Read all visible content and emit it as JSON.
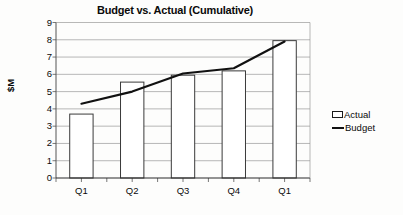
{
  "chart_data": {
    "type": "bar",
    "title": "Budget vs. Actual (Cumulative)",
    "xlabel": "",
    "ylabel": "$M",
    "categories": [
      "Q1",
      "Q2",
      "Q3",
      "Q4",
      "Q1"
    ],
    "yticks": [
      0,
      1,
      2,
      3,
      4,
      5,
      6,
      7,
      8,
      9
    ],
    "ylim": [
      0,
      9
    ],
    "grid": true,
    "legend_position": "right",
    "series": [
      {
        "name": "Actual",
        "type": "bar",
        "values": [
          3.7,
          5.55,
          5.95,
          6.2,
          7.95
        ]
      },
      {
        "name": "Budget",
        "type": "line",
        "values": [
          4.3,
          5.0,
          6.05,
          6.35,
          7.9
        ]
      }
    ]
  },
  "legend": {
    "items": [
      {
        "label": "Actual",
        "marker": "bar-swatch"
      },
      {
        "label": "Budget",
        "marker": "line-swatch"
      }
    ]
  },
  "colors": {
    "bar_fill": "#ffffff",
    "bar_stroke": "#3a3a3a",
    "line": "#111111",
    "axis": "#555555",
    "grid": "#9a9a9a",
    "text": "#0a0a0a",
    "background": "#fdfdfc"
  }
}
